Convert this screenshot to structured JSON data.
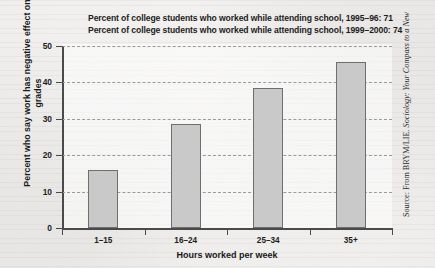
{
  "figure": {
    "title_lines": [
      "Percent of college students who worked while attending school, 1995–96: 71",
      "Percent of college students who worked while attending school, 1999–2000: 74"
    ],
    "source_prefix": "Source: From BRYM/LIE.",
    "source_italic": "Sociology: Your Compass to a New",
    "bar_fill": "#c9c9c9",
    "bar_border": "#6f6f6f",
    "gridline_color": "#9a9a9a",
    "axis_color": "#4a4a4a",
    "background": "#f2f1ef"
  },
  "chart_data": {
    "type": "bar",
    "categories": [
      "1–15",
      "16–24",
      "25–34",
      "35+"
    ],
    "values": [
      16,
      28.5,
      38.5,
      45.5
    ],
    "xlabel": "Hours worked per week",
    "ylabel": "Percent who say work has negative effect on grades",
    "ylim": [
      0,
      50
    ],
    "yticks": [
      0,
      10,
      20,
      30,
      40,
      50
    ],
    "ytick_labels": [
      "0",
      "10",
      "20",
      "30",
      "40",
      "50"
    ],
    "grid": "horizontal-dashed",
    "legend": "none",
    "annotations": [
      "Percent of college students who worked while attending school, 1995–96: 71",
      "Percent of college students who worked while attending school, 1999–2000: 74"
    ]
  }
}
